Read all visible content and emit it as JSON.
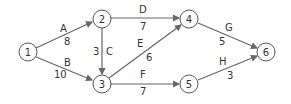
{
  "diagram": {
    "type": "network-graph",
    "nodes": [
      {
        "id": "1",
        "label": "1",
        "x": 28,
        "y": 52
      },
      {
        "id": "2",
        "label": "2",
        "x": 102,
        "y": 19
      },
      {
        "id": "3",
        "label": "3",
        "x": 102,
        "y": 84
      },
      {
        "id": "4",
        "label": "4",
        "x": 189,
        "y": 19
      },
      {
        "id": "5",
        "label": "5",
        "x": 189,
        "y": 84
      },
      {
        "id": "6",
        "label": "6",
        "x": 266,
        "y": 52
      }
    ],
    "edges": [
      {
        "from": "1",
        "to": "2",
        "name": "A",
        "weight": "8"
      },
      {
        "from": "1",
        "to": "3",
        "name": "B",
        "weight": "10"
      },
      {
        "from": "2",
        "to": "3",
        "name": "C",
        "weight": "3"
      },
      {
        "from": "2",
        "to": "4",
        "name": "D",
        "weight": "7"
      },
      {
        "from": "3",
        "to": "4",
        "name": "E",
        "weight": "6"
      },
      {
        "from": "3",
        "to": "5",
        "name": "F",
        "weight": "7"
      },
      {
        "from": "4",
        "to": "6",
        "name": "G",
        "weight": "5"
      },
      {
        "from": "5",
        "to": "6",
        "name": "H",
        "weight": "3"
      }
    ]
  }
}
